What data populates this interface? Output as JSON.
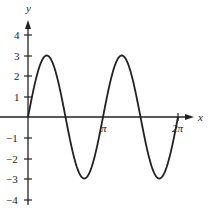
{
  "chart_data": {
    "type": "line",
    "title": "",
    "xlabel": "x",
    "ylabel": "y",
    "function": "y = 3 sin(2x)",
    "x_ticks": [
      "π",
      "2π"
    ],
    "x_tick_values": [
      3.14159,
      6.28319
    ],
    "y_ticks": [
      "-4",
      "-3",
      "-2",
      "-1",
      "1",
      "2",
      "3",
      "4"
    ],
    "y_tick_values": [
      -4,
      -3,
      -2,
      -1,
      1,
      2,
      3,
      4
    ],
    "xlim": [
      0,
      6.6
    ],
    "ylim": [
      -4,
      4.5
    ],
    "grid": false,
    "legend": null,
    "series": [
      {
        "name": "3 sin(2x)",
        "x": [
          0,
          0.3927,
          0.7854,
          1.1781,
          1.5708,
          1.9635,
          2.3562,
          2.7489,
          3.1416,
          3.5343,
          3.927,
          4.3197,
          4.7124,
          5.1051,
          5.4978,
          5.8905,
          6.2832
        ],
        "values": [
          0,
          2.12,
          3,
          2.12,
          0,
          -2.12,
          -3,
          -2.12,
          0,
          2.12,
          3,
          2.12,
          0,
          -2.12,
          -3,
          -2.12,
          0
        ]
      }
    ],
    "key_points": {
      "maxima": [
        [
          0.7854,
          3
        ],
        [
          3.927,
          3
        ]
      ],
      "minima": [
        [
          2.3562,
          -3
        ],
        [
          5.4978,
          -3
        ]
      ],
      "zeros": [
        0,
        1.5708,
        3.1416,
        4.7124,
        6.2832
      ]
    }
  },
  "labels": {
    "x_axis": "x",
    "y_axis": "y",
    "pi": "π",
    "two_pi": "2π",
    "y4": "4",
    "y3": "3",
    "y2": "2",
    "y1": "1",
    "ym1": "−1",
    "ym2": "−2",
    "ym3": "−3",
    "ym4": "−4"
  },
  "colors": {
    "axis": "#222222",
    "curve": "#222222",
    "background": "#ffffff"
  }
}
